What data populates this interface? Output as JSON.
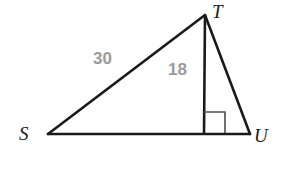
{
  "figure": {
    "kind": "geometry-diagram",
    "background_color": "#ffffff",
    "stroke_color": "#1a1a1a",
    "marker_color": "#4d4d4d",
    "measure_color": "#9a9a9a",
    "vertices": [
      {
        "name": "S",
        "label": "S",
        "x": 48,
        "y": 134
      },
      {
        "name": "T",
        "label": "T",
        "x": 205,
        "y": 15
      },
      {
        "name": "U",
        "label": "U",
        "x": 250,
        "y": 134
      },
      {
        "name": "F",
        "label": "",
        "x": 204,
        "y": 134
      }
    ],
    "segments": [
      {
        "name": "side-ST",
        "from": "S",
        "to": "T",
        "stroke_width": 2.6
      },
      {
        "name": "side-TU",
        "from": "T",
        "to": "U",
        "stroke_width": 2.6
      },
      {
        "name": "side-SU-base",
        "from": "S",
        "to": "U",
        "stroke_width": 2.6
      },
      {
        "name": "altitude-TF",
        "from": "T",
        "to": "F",
        "stroke_width": 2.6
      }
    ],
    "right_angle_marker": {
      "name": "right-angle-at-foot",
      "at_vertex": "F",
      "opens_toward": "U",
      "x": 204,
      "y": 112,
      "size": 21,
      "stroke_width": 1.5
    },
    "measures": [
      {
        "name": "measure-ST",
        "value": "30",
        "segment": "side-ST",
        "x": 93,
        "y": 50
      },
      {
        "name": "measure-TF",
        "value": "18",
        "segment": "altitude-TF",
        "x": 168,
        "y": 61
      }
    ]
  }
}
